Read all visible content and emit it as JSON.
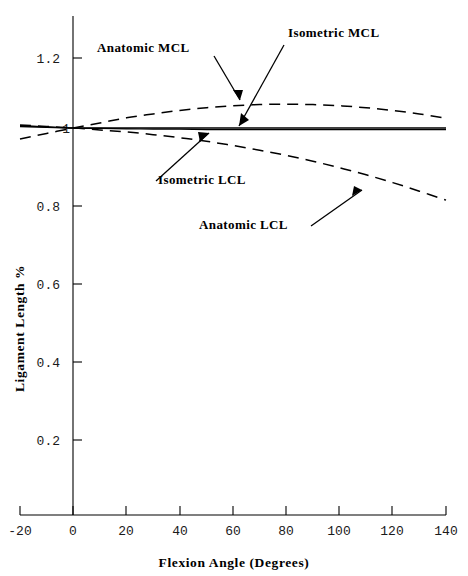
{
  "chart_data": {
    "type": "line",
    "title": "",
    "xlabel": "Flexion Angle (Degrees)",
    "ylabel": "Ligament Length %",
    "xlim": [
      -20,
      140
    ],
    "ylim": [
      0,
      1.3
    ],
    "xticks": [
      -20,
      0,
      20,
      40,
      60,
      80,
      100,
      120,
      140
    ],
    "xticklabels": [
      "-20",
      "0",
      "20",
      "40",
      "60",
      "80",
      "100",
      "120",
      "140"
    ],
    "yticks": [
      0.2,
      0.4,
      0.6,
      0.8,
      1,
      1.2
    ],
    "yticklabels": [
      "0.2",
      "0.4",
      "0.6",
      "0.8",
      "1",
      "1.2"
    ],
    "grid": false,
    "legend_position": "inline-annotations",
    "x": [
      -20,
      -10,
      0,
      10,
      20,
      30,
      40,
      50,
      60,
      70,
      80,
      90,
      100,
      110,
      120,
      130,
      140
    ],
    "series": [
      {
        "name": "Anatomic MCL",
        "style": "dashed",
        "values": [
          0.972,
          0.986,
          1.0,
          1.013,
          1.026,
          1.036,
          1.045,
          1.052,
          1.057,
          1.06,
          1.061,
          1.06,
          1.057,
          1.052,
          1.045,
          1.036,
          1.025
        ]
      },
      {
        "name": "Isometric MCL",
        "style": "solid",
        "values": [
          1.004,
          1.002,
          1.0,
          1.0,
          1.0,
          1.0,
          1.0,
          1.0,
          1.0,
          1.0,
          1.0,
          1.0,
          1.0,
          1.0,
          1.0,
          1.0,
          1.0
        ]
      },
      {
        "name": "Isometric LCL",
        "style": "solid",
        "values": [
          1.006,
          1.003,
          1.0,
          0.999,
          0.998,
          0.997,
          0.997,
          0.996,
          0.996,
          0.996,
          0.996,
          0.996,
          0.996,
          0.996,
          0.996,
          0.996,
          0.996
        ]
      },
      {
        "name": "Anatomic LCL",
        "style": "dashed",
        "values": [
          1.008,
          1.004,
          1.0,
          0.995,
          0.99,
          0.983,
          0.975,
          0.966,
          0.955,
          0.943,
          0.93,
          0.915,
          0.898,
          0.88,
          0.86,
          0.838,
          0.815
        ]
      }
    ],
    "annotations": [
      {
        "name": "anatomic-mcl",
        "text": "Anatomic MCL"
      },
      {
        "name": "isometric-mcl",
        "text": "Isometric MCL"
      },
      {
        "name": "isometric-lcl",
        "text": "Isometric LCL"
      },
      {
        "name": "anatomic-lcl",
        "text": "Anatomic LCL"
      }
    ]
  }
}
